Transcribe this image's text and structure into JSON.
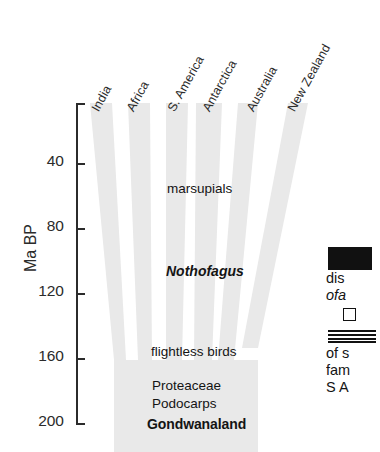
{
  "figure": {
    "type": "diagram-chart",
    "axis": {
      "title": "Ma  BP",
      "ticks": [
        {
          "value": "",
          "y": 103
        },
        {
          "value": "40",
          "y": 163
        },
        {
          "value": "80",
          "y": 228
        },
        {
          "value": "120",
          "y": 293
        },
        {
          "value": "160",
          "y": 358
        },
        {
          "value": "200",
          "y": 423
        }
      ],
      "range": [
        0,
        210
      ],
      "units": "Ma BP"
    },
    "columns": [
      {
        "label": "India",
        "x": 101,
        "y": 100
      },
      {
        "label": "Africa",
        "x": 136,
        "y": 100
      },
      {
        "label": "S. America",
        "x": 177,
        "y": 100
      },
      {
        "label": "Antarctica",
        "x": 212,
        "y": 100
      },
      {
        "label": "Australia",
        "x": 256,
        "y": 100
      },
      {
        "label": "New Zealand",
        "x": 297,
        "y": 100
      }
    ],
    "events": [
      {
        "label": "marsupials",
        "x": 167,
        "y": 181,
        "style": "plain"
      },
      {
        "label": "Nothofagus",
        "x": 166,
        "y": 263,
        "style": "italic"
      },
      {
        "label": "flightless birds",
        "x": 151,
        "y": 344,
        "style": "plain"
      },
      {
        "label": "Proteaceae",
        "x": 152,
        "y": 378,
        "style": "plain"
      },
      {
        "label": "Podocarps",
        "x": 152,
        "y": 396,
        "style": "plain"
      },
      {
        "label": "Gondwanaland",
        "x": 147,
        "y": 416,
        "style": "bold"
      }
    ],
    "legend": {
      "rows": [
        {
          "swatch": "solid-black-bar",
          "lines": [
            "dis",
            "ofa"
          ]
        },
        {
          "swatch": "open-square",
          "lines": []
        },
        {
          "swatch": "horizontal-lines",
          "lines": [
            "of s",
            "fam",
            "S A"
          ]
        }
      ],
      "clipped": true
    },
    "colors": {
      "band_fill": "#e9e9e9",
      "axis": "#2b2b2b",
      "text": "#141414",
      "legend_solid": "#111111",
      "background": "#ffffff"
    }
  }
}
